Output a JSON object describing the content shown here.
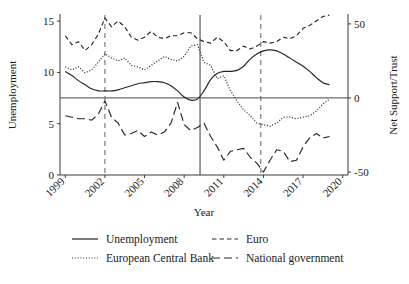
{
  "chart_data": {
    "type": "line",
    "title": "",
    "xlabel": "Year",
    "ylabel": "Unemployment",
    "y2label": "Net Support/Trust",
    "xlim": [
      1998.6,
      2020.4
    ],
    "ylim": [
      0,
      15.6
    ],
    "y2lim": [
      -52,
      56
    ],
    "xticks": [
      1999,
      2002,
      2005,
      2008,
      2011,
      2014,
      2017,
      2020
    ],
    "xticklabels": [
      "1999",
      "2002",
      "2005",
      "2008",
      "2011",
      "2014",
      "2017",
      "2020"
    ],
    "yticks": [
      0,
      5,
      10,
      15
    ],
    "yticklabels": [
      "0",
      "5",
      "10",
      "15"
    ],
    "y2ticks": [
      -50,
      0,
      50
    ],
    "y2ticklabels": [
      "-50",
      "0",
      "50"
    ],
    "grid": false,
    "legend_position": "below",
    "reference_lines": {
      "horizontal_zero_right_axis": 0,
      "vertical": [
        {
          "x": 2002.0,
          "style": "dashed"
        },
        {
          "x": 2009.2,
          "style": "solid"
        },
        {
          "x": 2013.8,
          "style": "dashed"
        }
      ]
    },
    "series": [
      {
        "name": "Unemployment",
        "axis": "left",
        "style": "solid",
        "x": [
          1999.0,
          1999.5,
          2000.0,
          2000.5,
          2001.0,
          2001.5,
          2002.0,
          2002.5,
          2003.0,
          2003.5,
          2004.0,
          2004.5,
          2005.0,
          2005.5,
          2006.0,
          2006.5,
          2007.0,
          2007.5,
          2008.0,
          2008.5,
          2009.0,
          2009.5,
          2010.0,
          2010.5,
          2011.0,
          2011.5,
          2012.0,
          2012.5,
          2013.0,
          2013.5,
          2014.0,
          2014.5,
          2015.0,
          2015.5,
          2016.0,
          2016.5,
          2017.0,
          2017.5,
          2018.0,
          2018.5,
          2019.0
        ],
        "y": [
          10.1,
          9.7,
          9.2,
          8.8,
          8.4,
          8.2,
          8.2,
          8.2,
          8.3,
          8.5,
          8.7,
          8.9,
          9.0,
          9.1,
          9.1,
          9.0,
          8.7,
          8.2,
          7.6,
          7.3,
          7.4,
          8.2,
          9.3,
          9.9,
          10.1,
          10.1,
          10.2,
          10.6,
          11.3,
          11.8,
          12.1,
          12.2,
          12.1,
          11.8,
          11.4,
          11.0,
          10.6,
          10.1,
          9.5,
          9.0,
          8.8
        ]
      },
      {
        "name": "European Central Bank",
        "axis": "right",
        "style": "dotted",
        "x": [
          1999.0,
          1999.5,
          2000.0,
          2000.5,
          2001.0,
          2001.5,
          2002.0,
          2002.5,
          2003.0,
          2003.5,
          2004.0,
          2004.5,
          2005.0,
          2005.5,
          2006.0,
          2006.5,
          2007.0,
          2007.5,
          2008.0,
          2008.5,
          2009.0,
          2009.5,
          2010.0,
          2010.5,
          2011.0,
          2011.5,
          2012.0,
          2012.5,
          2013.0,
          2013.5,
          2014.0,
          2014.5,
          2015.0,
          2015.5,
          2016.0,
          2016.5,
          2017.0,
          2017.5,
          2018.0,
          2018.5,
          2019.0
        ],
        "y": [
          21,
          19,
          21,
          17,
          19,
          24,
          30,
          27,
          25,
          27,
          22,
          21,
          19,
          22,
          25,
          28,
          26,
          25,
          28,
          35,
          36,
          24,
          22,
          13,
          15,
          5,
          -2,
          -8,
          -12,
          -17,
          -18,
          -19,
          -17,
          -13,
          -13,
          -14,
          -13,
          -12,
          -9,
          -4,
          -1
        ]
      },
      {
        "name": "Euro",
        "axis": "right",
        "style": "shortdash",
        "x": [
          1999.0,
          1999.5,
          2000.0,
          2000.5,
          2001.0,
          2001.5,
          2002.0,
          2002.5,
          2003.0,
          2003.5,
          2004.0,
          2004.5,
          2005.0,
          2005.5,
          2006.0,
          2006.5,
          2007.0,
          2007.5,
          2008.0,
          2008.5,
          2009.0,
          2009.5,
          2010.0,
          2010.5,
          2011.0,
          2011.5,
          2012.0,
          2012.5,
          2013.0,
          2013.5,
          2014.0,
          2014.5,
          2015.0,
          2015.5,
          2016.0,
          2016.5,
          2017.0,
          2017.5,
          2018.0,
          2018.5,
          2019.0
        ],
        "y": [
          42,
          36,
          38,
          32,
          36,
          43,
          54,
          48,
          52,
          48,
          41,
          39,
          41,
          45,
          41,
          40,
          42,
          42,
          44,
          44,
          40,
          38,
          37,
          41,
          38,
          32,
          32,
          35,
          33,
          35,
          38,
          37,
          38,
          41,
          40,
          42,
          47,
          49,
          52,
          55,
          56
        ]
      },
      {
        "name": "National government",
        "axis": "right",
        "style": "longdash",
        "x": [
          1999.0,
          1999.5,
          2000.0,
          2000.5,
          2001.0,
          2001.5,
          2002.0,
          2002.5,
          2003.0,
          2003.5,
          2004.0,
          2004.5,
          2005.0,
          2005.5,
          2006.0,
          2006.5,
          2007.0,
          2007.5,
          2008.0,
          2008.5,
          2009.0,
          2009.5,
          2010.0,
          2010.5,
          2011.0,
          2011.5,
          2012.0,
          2012.5,
          2013.0,
          2013.5,
          2014.0,
          2014.5,
          2015.0,
          2015.5,
          2016.0,
          2016.5,
          2017.0,
          2017.5,
          2018.0,
          2018.5,
          2019.0
        ],
        "y": [
          -12,
          -13,
          -14,
          -14,
          -15,
          -11,
          -2,
          -13,
          -17,
          -25,
          -24,
          -22,
          -26,
          -23,
          -25,
          -23,
          -17,
          -3,
          -18,
          -22,
          -20,
          -17,
          -26,
          -33,
          -42,
          -36,
          -35,
          -34,
          -40,
          -44,
          -50,
          -42,
          -35,
          -36,
          -43,
          -42,
          -33,
          -27,
          -24,
          -27,
          -26
        ]
      }
    ],
    "legend": [
      {
        "label": "Unemployment",
        "style": "solid"
      },
      {
        "label": "Euro",
        "style": "shortdash"
      },
      {
        "label": "European Central Bank",
        "style": "dotted"
      },
      {
        "label": "National government",
        "style": "longdash"
      }
    ]
  }
}
